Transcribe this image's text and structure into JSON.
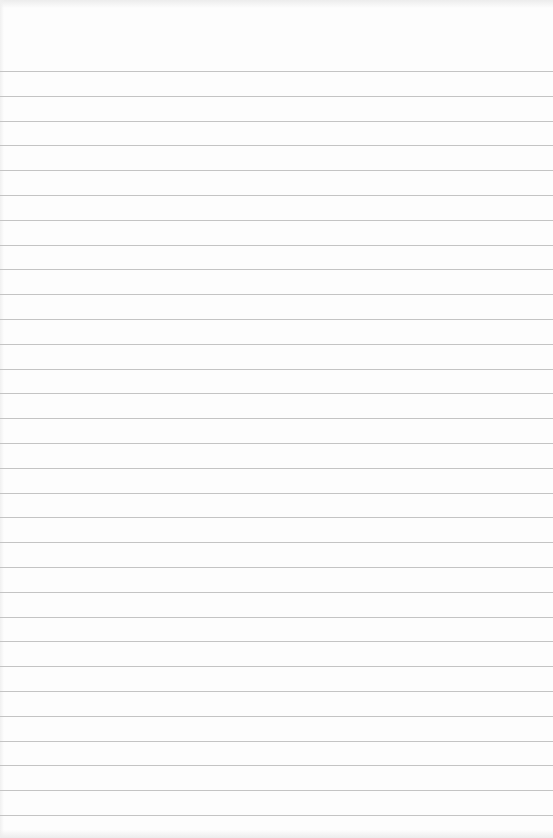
{
  "page": {
    "type": "lined-paper",
    "background_color": "#fdfdfd",
    "line_color": "#c4c4c4",
    "first_line_y": 71,
    "line_spacing": 24.8,
    "line_count": 31
  }
}
